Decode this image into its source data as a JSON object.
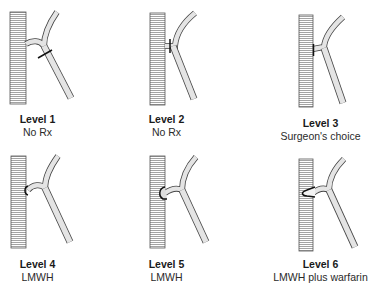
{
  "figure": {
    "panels": [
      {
        "level": "Level 1",
        "treatment": "No Rx",
        "thrombus": "distal-to-junction",
        "x": 0,
        "y": 0,
        "vein_offset": 10,
        "label_center": 37
      },
      {
        "level": "Level 2",
        "treatment": "No Rx",
        "thrombus": "at-junction-ostium",
        "x": 123,
        "y": 0,
        "vein_offset": 27,
        "label_center": 43
      },
      {
        "level": "Level 3",
        "treatment": "Surgeon's choice",
        "thrombus": "filling-junction",
        "x": 245,
        "y": 0,
        "vein_offset": 54,
        "label_center": 75
      },
      {
        "level": "Level 4",
        "treatment": "LMWH",
        "thrombus": "bulging-into-deep-vein",
        "x": 0,
        "y": 144,
        "vein_offset": 10,
        "label_center": 37
      },
      {
        "level": "Level 5",
        "treatment": "LMWH",
        "thrombus": "protruding-into-deep-vein",
        "x": 123,
        "y": 144,
        "vein_offset": 27,
        "label_center": 43
      },
      {
        "level": "Level 6",
        "treatment": "LMWH plus warfarin",
        "thrombus": "extending-into-deep-vein",
        "x": 245,
        "y": 144,
        "vein_offset": 54,
        "label_center": 75
      }
    ]
  },
  "colors": {
    "vessel_stroke": "#3a3a3a",
    "vessel_fill": "#e4e4e4",
    "hatch": "#9a9a9a",
    "thrombus": "#111111",
    "text": "#1a1a1a"
  }
}
